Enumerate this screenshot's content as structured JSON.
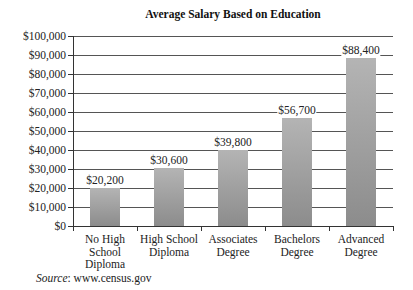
{
  "chart_data": {
    "type": "bar",
    "title": "Average Salary Based on Education",
    "categories": [
      "No High School Diploma",
      "High School Diploma",
      "Associates Degree",
      "Bachelors Degree",
      "Advanced Degree"
    ],
    "category_lines": [
      [
        "No High",
        "School",
        "Diploma"
      ],
      [
        "High School",
        "Diploma"
      ],
      [
        "Associates",
        "Degree"
      ],
      [
        "Bachelors",
        "Degree"
      ],
      [
        "Advanced",
        "Degree"
      ]
    ],
    "values": [
      20200,
      30600,
      39800,
      56700,
      88400
    ],
    "value_labels": [
      "$20,200",
      "$30,600",
      "$39,800",
      "$56,700",
      "$88,400"
    ],
    "xlabel": "",
    "ylabel": "",
    "ylim": [
      0,
      100000
    ],
    "yticks": [
      0,
      10000,
      20000,
      30000,
      40000,
      50000,
      60000,
      70000,
      80000,
      90000,
      100000
    ],
    "ytick_labels": [
      "$0",
      "$10,000",
      "$20,000",
      "$30,000",
      "$40,000",
      "$50,000",
      "$60,000",
      "$70,000",
      "$80,000",
      "$90,000",
      "$100,000"
    ],
    "grid": true,
    "legend": null,
    "bar_color": "#9e9e9e"
  },
  "source": {
    "label": "Source",
    "text": ": www.census.gov"
  }
}
